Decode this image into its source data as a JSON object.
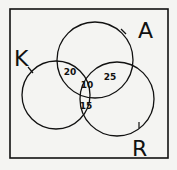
{
  "diagram": {
    "type": "venn",
    "sets": [
      {
        "label": "A",
        "cx": 95,
        "cy": 60,
        "r": 38,
        "label_x": 138,
        "label_y": 38
      },
      {
        "label": "K",
        "cx": 56,
        "cy": 95,
        "r": 34,
        "label_x": 14,
        "label_y": 66
      },
      {
        "label": "R",
        "cx": 117,
        "cy": 99,
        "r": 37,
        "label_x": 132,
        "label_y": 156
      }
    ],
    "regions": [
      {
        "sets": "A∩K only",
        "value": "20",
        "x": 70,
        "y": 75
      },
      {
        "sets": "A∩R only",
        "value": "25",
        "x": 110,
        "y": 80
      },
      {
        "sets": "A∩K∩R",
        "value": "10",
        "x": 87,
        "y": 88
      },
      {
        "sets": "K∩R only",
        "value": "15",
        "x": 86,
        "y": 109
      }
    ],
    "colors": {
      "stroke": "#111111",
      "background": "#f4f4f2"
    }
  }
}
